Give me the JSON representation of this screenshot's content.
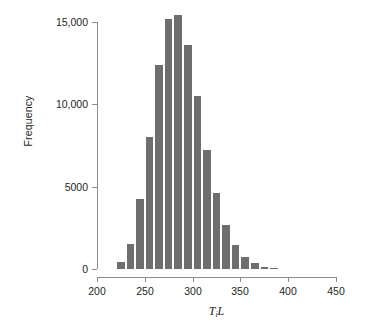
{
  "chart_data": {
    "type": "bar",
    "title": "",
    "subtitle": "",
    "xlabel": "T_i L",
    "xlabel_parts": {
      "symbol1": "T",
      "subscript": "i",
      "symbol2": "L"
    },
    "ylabel": "Frequency",
    "xlim": [
      200,
      450
    ],
    "ylim": [
      0,
      15800
    ],
    "grid": false,
    "legend": null,
    "bin_width": 10,
    "xticks": [
      "200",
      "250",
      "300",
      "350",
      "400",
      "450"
    ],
    "xtick_values": [
      200,
      250,
      300,
      350,
      400,
      450
    ],
    "yticks": [
      "0",
      "5000",
      "10,000",
      "15,000"
    ],
    "ytick_values": [
      0,
      5000,
      10000,
      15000
    ],
    "bar_color": "#6e6e6e",
    "axis_color": "#8c8c8c",
    "text_color": "#231f20",
    "bin_starts": [
      220,
      230,
      240,
      250,
      260,
      270,
      280,
      290,
      300,
      310,
      320,
      330,
      340,
      350,
      360,
      370,
      380
    ],
    "categories": [
      "220-230",
      "230-240",
      "240-250",
      "250-260",
      "260-270",
      "270-280",
      "280-290",
      "290-300",
      "300-310",
      "310-320",
      "320-330",
      "330-340",
      "340-350",
      "350-360",
      "360-370",
      "370-380",
      "380-390"
    ],
    "values": [
      400,
      1500,
      4250,
      8000,
      12400,
      15200,
      15450,
      13600,
      10500,
      7250,
      4600,
      2700,
      1450,
      700,
      350,
      120,
      60
    ]
  }
}
